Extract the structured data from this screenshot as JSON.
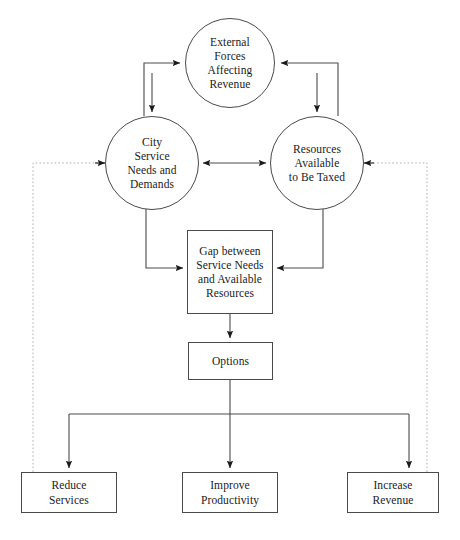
{
  "diagram": {
    "type": "flow-diagram",
    "canvas": {
      "width": 460,
      "height": 540,
      "background": "#ffffff"
    },
    "colors": {
      "stroke": "#4a4a4a",
      "arrow": "#1a1a1a",
      "dotted": "#b0b0b0",
      "text": "#1a1a1a",
      "background": "#ffffff"
    },
    "nodes": [
      {
        "id": "external-forces",
        "shape": "circle",
        "label": "External\nForces\nAffecting\nRevenue"
      },
      {
        "id": "city-service",
        "shape": "circle",
        "label": "City\nService\nNeeds and\nDemands"
      },
      {
        "id": "resources",
        "shape": "circle",
        "label": "Resources\nAvailable\nto Be Taxed"
      },
      {
        "id": "gap",
        "shape": "rect",
        "label": "Gap between\nService Needs\nand Available\nResources"
      },
      {
        "id": "options",
        "shape": "rect",
        "label": "Options"
      },
      {
        "id": "reduce-services",
        "shape": "rect",
        "label": "Reduce\nServices"
      },
      {
        "id": "improve-productivity",
        "shape": "rect",
        "label": "Improve\nProductivity"
      },
      {
        "id": "increase-revenue",
        "shape": "rect",
        "label": "Increase\nRevenue"
      }
    ],
    "edges": [
      {
        "id": "city-to-external",
        "from": "city-service",
        "to": "external-forces",
        "style": "solid",
        "arrow": "end"
      },
      {
        "id": "resources-to-external",
        "from": "resources",
        "to": "external-forces",
        "style": "solid",
        "arrow": "end"
      },
      {
        "id": "external-to-city",
        "from": "external-forces",
        "to": "city-service",
        "style": "solid",
        "arrow": "end"
      },
      {
        "id": "external-to-resources",
        "from": "external-forces",
        "to": "resources",
        "style": "solid",
        "arrow": "end"
      },
      {
        "id": "city-resources-link",
        "from": "city-service",
        "to": "resources",
        "style": "solid",
        "arrow": "both"
      },
      {
        "id": "city-to-gap",
        "from": "city-service",
        "to": "gap",
        "style": "solid",
        "arrow": "end"
      },
      {
        "id": "resources-to-gap",
        "from": "resources",
        "to": "gap",
        "style": "solid",
        "arrow": "end"
      },
      {
        "id": "gap-to-options",
        "from": "gap",
        "to": "options",
        "style": "solid",
        "arrow": "end"
      },
      {
        "id": "options-to-reduce-services",
        "from": "options",
        "to": "reduce-services",
        "style": "solid",
        "arrow": "end"
      },
      {
        "id": "options-to-improve-productivity",
        "from": "options",
        "to": "improve-productivity",
        "style": "solid",
        "arrow": "end"
      },
      {
        "id": "options-to-increase-revenue",
        "from": "options",
        "to": "increase-revenue",
        "style": "solid",
        "arrow": "end"
      },
      {
        "id": "reduce-services-feedback",
        "from": "reduce-services",
        "to": "city-service",
        "style": "dotted",
        "arrow": "end"
      },
      {
        "id": "increase-revenue-feedback",
        "from": "increase-revenue",
        "to": "resources",
        "style": "dotted",
        "arrow": "end"
      }
    ]
  }
}
